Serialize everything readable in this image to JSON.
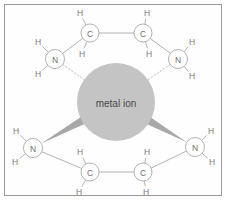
{
  "figure": {
    "kind": "chemical-structure",
    "border_color": "#9a9a9a",
    "background_color": "#ffffff"
  },
  "metal_ion": {
    "label": "metal ion",
    "fill": "#c4c4c4",
    "text_color": "#4a4a4a",
    "cx": 116,
    "cy": 102,
    "r": 39
  },
  "atoms": [
    {
      "id": "N1",
      "label": "N",
      "cx": 55,
      "cy": 59,
      "r": 9.5,
      "kind": "nitrogen"
    },
    {
      "id": "C1",
      "label": "C",
      "cx": 90,
      "cy": 33,
      "r": 9.0,
      "kind": "carbon"
    },
    {
      "id": "C2",
      "label": "C",
      "cx": 143,
      "cy": 33,
      "r": 9.0,
      "kind": "carbon"
    },
    {
      "id": "N2",
      "label": "N",
      "cx": 178,
      "cy": 59,
      "r": 9.5,
      "kind": "nitrogen"
    },
    {
      "id": "N3",
      "label": "N",
      "cx": 33,
      "cy": 148,
      "r": 9.5,
      "kind": "nitrogen"
    },
    {
      "id": "C3",
      "label": "C",
      "cx": 90,
      "cy": 172,
      "r": 9.0,
      "kind": "carbon"
    },
    {
      "id": "C4",
      "label": "C",
      "cx": 143,
      "cy": 172,
      "r": 9.0,
      "kind": "carbon"
    },
    {
      "id": "N4",
      "label": "N",
      "cx": 195,
      "cy": 147,
      "r": 9.5,
      "kind": "nitrogen"
    }
  ],
  "hydrogens": [
    {
      "id": "H1",
      "label": "H",
      "x": 38,
      "y": 42,
      "bond_to": "N1"
    },
    {
      "id": "H2",
      "label": "H",
      "x": 38,
      "y": 74,
      "bond_to": "N1"
    },
    {
      "id": "H3",
      "label": "H",
      "x": 80,
      "y": 13,
      "bond_to": "C1"
    },
    {
      "id": "H4",
      "label": "H",
      "x": 82,
      "y": 54,
      "bond_to": "C1"
    },
    {
      "id": "H5",
      "label": "H",
      "x": 147,
      "y": 13,
      "bond_to": "C2"
    },
    {
      "id": "H6",
      "label": "H",
      "x": 149,
      "y": 54,
      "bond_to": "C2"
    },
    {
      "id": "H7",
      "label": "H",
      "x": 192,
      "y": 42,
      "bond_to": "N2"
    },
    {
      "id": "H8",
      "label": "H",
      "x": 192,
      "y": 76,
      "bond_to": "N2"
    },
    {
      "id": "H9",
      "label": "H",
      "x": 16,
      "y": 131,
      "bond_to": "N3"
    },
    {
      "id": "H10",
      "label": "H",
      "x": 15,
      "y": 162,
      "bond_to": "N3"
    },
    {
      "id": "H11",
      "label": "H",
      "x": 80,
      "y": 152,
      "bond_to": "C3"
    },
    {
      "id": "H12",
      "label": "H",
      "x": 79,
      "y": 192,
      "bond_to": "C3"
    },
    {
      "id": "H13",
      "label": "H",
      "x": 147,
      "y": 152,
      "bond_to": "C4"
    },
    {
      "id": "H14",
      "label": "H",
      "x": 146,
      "y": 192,
      "bond_to": "C4"
    },
    {
      "id": "H15",
      "label": "H",
      "x": 211,
      "y": 131,
      "bond_to": "N4"
    },
    {
      "id": "H16",
      "label": "H",
      "x": 212,
      "y": 162,
      "bond_to": "N4"
    }
  ],
  "bonds": [
    {
      "from": "N1",
      "to": "C1",
      "style": "solid"
    },
    {
      "from": "C1",
      "to": "C2",
      "style": "solid"
    },
    {
      "from": "C2",
      "to": "N2",
      "style": "solid"
    },
    {
      "from": "N3",
      "to": "C3",
      "style": "solid"
    },
    {
      "from": "C3",
      "to": "C4",
      "style": "solid"
    },
    {
      "from": "C4",
      "to": "N4",
      "style": "solid"
    }
  ],
  "coordinate_bonds": [
    {
      "from": "N1",
      "to": "metal_ion",
      "style": "dotted",
      "color": "#cfcfcf"
    },
    {
      "from": "N2",
      "to": "metal_ion",
      "style": "dotted",
      "color": "#cfcfcf"
    },
    {
      "from": "N3",
      "to": "metal_ion",
      "style": "wedge",
      "color": "#a8a8a8"
    },
    {
      "from": "N4",
      "to": "metal_ion",
      "style": "wedge",
      "color": "#a8a8a8"
    }
  ],
  "style": {
    "bond_color": "#a9a9a9",
    "atom_circle_stroke": "#a9a9a9",
    "atom_circle_fill": "#ffffff",
    "atom_text_color": "#6e6e6e",
    "hydrogen_text_color": "#7a7a7a"
  }
}
